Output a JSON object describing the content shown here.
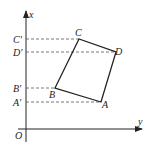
{
  "diagram": {
    "type": "coordinate-quadrilateral-projection",
    "colors": {
      "line": "#222222",
      "dash": "#555555",
      "background": "#ffffff"
    },
    "axes": {
      "vertical_label": "x",
      "horizontal_label": "y",
      "origin_label": "O"
    },
    "vertices": [
      {
        "name": "A",
        "label": "A",
        "px": 101,
        "py": 102
      },
      {
        "name": "B",
        "label": "B",
        "px": 55,
        "py": 88
      },
      {
        "name": "C",
        "label": "C",
        "px": 79,
        "py": 39
      },
      {
        "name": "D",
        "label": "D",
        "px": 116,
        "py": 52
      }
    ],
    "projections": [
      {
        "label": "C'",
        "py": 39
      },
      {
        "label": "D'",
        "py": 52
      },
      {
        "label": "B'",
        "py": 88
      },
      {
        "label": "A'",
        "py": 102
      }
    ]
  }
}
